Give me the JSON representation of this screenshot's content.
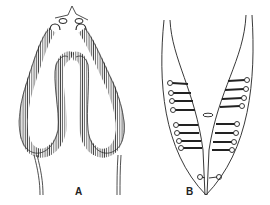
{
  "figure": {
    "panels": [
      {
        "id": "A",
        "label": "A",
        "description": "Folded hatched tubular structure (inverted U within outer loop) with two knob-like openings at top and two trailing lines at bottom"
      },
      {
        "id": "B",
        "label": "B",
        "description": "V-shaped outline with paired lateral rods ending in small circles, a central oval, and two small circles near the apex"
      }
    ],
    "colors": {
      "ink": "#222222",
      "background": "#ffffff"
    }
  }
}
